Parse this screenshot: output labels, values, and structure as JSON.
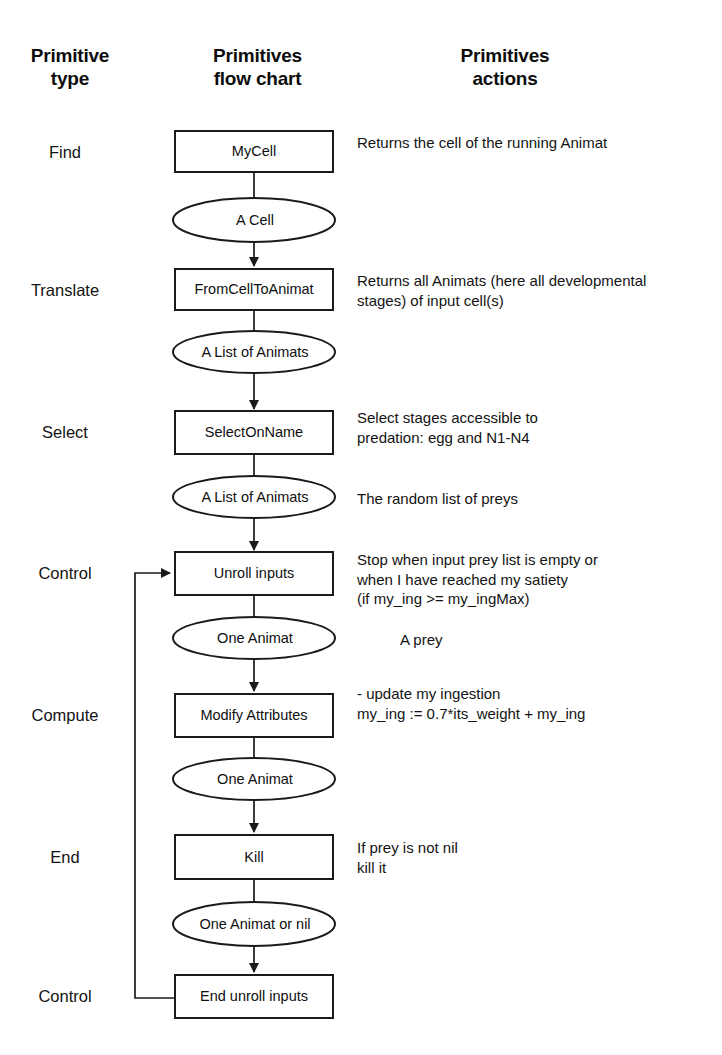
{
  "headers": {
    "type": "Primitive\ntype",
    "flow": "Primitives\nflow chart",
    "actions": "Primitives\nactions"
  },
  "colors": {
    "stroke": "#1a1a1a",
    "fill": "#ffffff",
    "text": "#111111",
    "background": "#ffffff"
  },
  "rows": [
    {
      "type": "Find",
      "process": "MyCell",
      "data": "A Cell",
      "process_action": "Returns the cell of the running Animat",
      "data_action": ""
    },
    {
      "type": "Translate",
      "process": "FromCellToAnimat",
      "data": "A List of Animats",
      "process_action": "Returns all Animats (here all developmental\nstages) of input cell(s)",
      "data_action": ""
    },
    {
      "type": "Select",
      "process": "SelectOnName",
      "data": "A List of Animats",
      "process_action": "Select stages accessible to\npredation: egg and  N1-N4",
      "data_action": "The random list of preys"
    },
    {
      "type": "Control",
      "process": "Unroll inputs",
      "data": "One Animat",
      "process_action": "Stop when input prey list is empty or\nwhen I have reached my satiety\n(if my_ing >= my_ingMax)",
      "data_action": "A  prey"
    },
    {
      "type": "Compute",
      "process": "Modify Attributes",
      "data": "One Animat",
      "process_action": "- update my ingestion\nmy_ing := 0.7*its_weight + my_ing",
      "data_action": ""
    },
    {
      "type": "End",
      "process": "Kill",
      "data": "One Animat or nil",
      "process_action": "If prey is not nil\nkill it",
      "data_action": ""
    },
    {
      "type": "Control",
      "process": "End unroll inputs",
      "data": "",
      "process_action": "",
      "data_action": ""
    }
  ],
  "chart_data": {
    "type": "flowchart",
    "orientation": "top-to-bottom",
    "node_shapes": {
      "process": "rectangle",
      "data": "ellipse"
    },
    "nodes": [
      {
        "id": "n1",
        "shape": "rectangle",
        "label": "MyCell",
        "type": "Find",
        "x": 254,
        "y": 151
      },
      {
        "id": "n2",
        "shape": "ellipse",
        "label": "A Cell",
        "type": "Find",
        "x": 254,
        "y": 220
      },
      {
        "id": "n3",
        "shape": "rectangle",
        "label": "FromCellToAnimat",
        "type": "Translate",
        "x": 254,
        "y": 289
      },
      {
        "id": "n4",
        "shape": "ellipse",
        "label": "A List of Animats",
        "type": "Translate",
        "x": 254,
        "y": 352
      },
      {
        "id": "n5",
        "shape": "rectangle",
        "label": "SelectOnName",
        "type": "Select",
        "x": 254,
        "y": 432
      },
      {
        "id": "n6",
        "shape": "ellipse",
        "label": "A List of Animats",
        "type": "Select",
        "x": 254,
        "y": 497
      },
      {
        "id": "n7",
        "shape": "rectangle",
        "label": "Unroll inputs",
        "type": "Control",
        "x": 254,
        "y": 573
      },
      {
        "id": "n8",
        "shape": "ellipse",
        "label": "One Animat",
        "type": "Control",
        "x": 254,
        "y": 638
      },
      {
        "id": "n9",
        "shape": "rectangle",
        "label": "Modify Attributes",
        "type": "Compute",
        "x": 254,
        "y": 715
      },
      {
        "id": "n10",
        "shape": "ellipse",
        "label": "One Animat",
        "type": "Compute",
        "x": 254,
        "y": 779
      },
      {
        "id": "n11",
        "shape": "rectangle",
        "label": "Kill",
        "type": "End",
        "x": 254,
        "y": 857
      },
      {
        "id": "n12",
        "shape": "ellipse",
        "label": "One Animat or nil",
        "type": "End",
        "x": 254,
        "y": 924
      },
      {
        "id": "n13",
        "shape": "rectangle",
        "label": "End unroll inputs",
        "type": "Control",
        "x": 254,
        "y": 996
      }
    ],
    "edges": [
      {
        "from": "n1",
        "to": "n2",
        "arrow": false
      },
      {
        "from": "n2",
        "to": "n3",
        "arrow": true
      },
      {
        "from": "n3",
        "to": "n4",
        "arrow": false
      },
      {
        "from": "n4",
        "to": "n5",
        "arrow": true
      },
      {
        "from": "n5",
        "to": "n6",
        "arrow": false
      },
      {
        "from": "n6",
        "to": "n7",
        "arrow": true
      },
      {
        "from": "n7",
        "to": "n8",
        "arrow": false
      },
      {
        "from": "n8",
        "to": "n9",
        "arrow": true
      },
      {
        "from": "n9",
        "to": "n10",
        "arrow": false
      },
      {
        "from": "n10",
        "to": "n11",
        "arrow": true
      },
      {
        "from": "n11",
        "to": "n12",
        "arrow": false
      },
      {
        "from": "n12",
        "to": "n13",
        "arrow": true
      },
      {
        "from": "n13",
        "to": "n7",
        "arrow": true,
        "routing": "loop-back-left",
        "rail_x": 135
      }
    ]
  }
}
